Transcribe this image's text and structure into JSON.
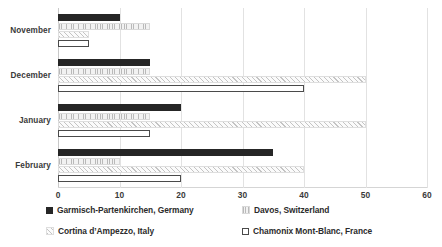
{
  "chart_data": {
    "type": "bar",
    "orientation": "horizontal",
    "title": "",
    "xlabel": "",
    "ylabel": "",
    "categories": [
      "November",
      "December",
      "January",
      "February"
    ],
    "series": [
      {
        "name": "Garmisch-Partenkirchen, Germany",
        "values": [
          10,
          15,
          20,
          35
        ],
        "color": "#262626",
        "marker": "solid-dark"
      },
      {
        "name": "Davos, Switzerland",
        "values": [
          15,
          15,
          15,
          10
        ],
        "color": "#e8e8e8",
        "marker": "light-vertical-hatch"
      },
      {
        "name": "Cortina d’Ampezzo, Italy",
        "values": [
          5,
          50,
          50,
          40
        ],
        "color": "#f0f0f0",
        "marker": "diagonal-hatch"
      },
      {
        "name": "Chamonix Mont-Blanc, France",
        "values": [
          5,
          40,
          15,
          20
        ],
        "color": "#ffffff",
        "marker": "white-outline"
      }
    ],
    "xlim": [
      0,
      60
    ],
    "xticks": [
      0,
      10,
      20,
      30,
      40,
      50,
      60
    ],
    "xtick_labels": [
      "0",
      "10",
      "20",
      "30",
      "40",
      "50",
      "60"
    ],
    "grid": true,
    "grid_axis": "x",
    "legend_position": "bottom"
  },
  "axis": {
    "ticks": [
      {
        "label": "0",
        "value": 0
      },
      {
        "label": "10",
        "value": 10
      },
      {
        "label": "20",
        "value": 20
      },
      {
        "label": "30",
        "value": 30
      },
      {
        "label": "40",
        "value": 40
      },
      {
        "label": "50",
        "value": 50
      },
      {
        "label": "60",
        "value": 60
      }
    ]
  },
  "categories": [
    {
      "label": "November"
    },
    {
      "label": "December"
    },
    {
      "label": "January"
    },
    {
      "label": "February"
    }
  ],
  "legend": {
    "items": [
      {
        "label": "Garmisch-Partenkirchen, Germany",
        "swatch": "solid-dark-swatch"
      },
      {
        "label": "Davos, Switzerland",
        "swatch": "light-hatch-swatch"
      },
      {
        "label": "Cortina d’Ampezzo, Italy",
        "swatch": "diagonal-hatch-swatch"
      },
      {
        "label": "Chamonix Mont-Blanc, France",
        "swatch": "white-outline-swatch"
      }
    ]
  }
}
